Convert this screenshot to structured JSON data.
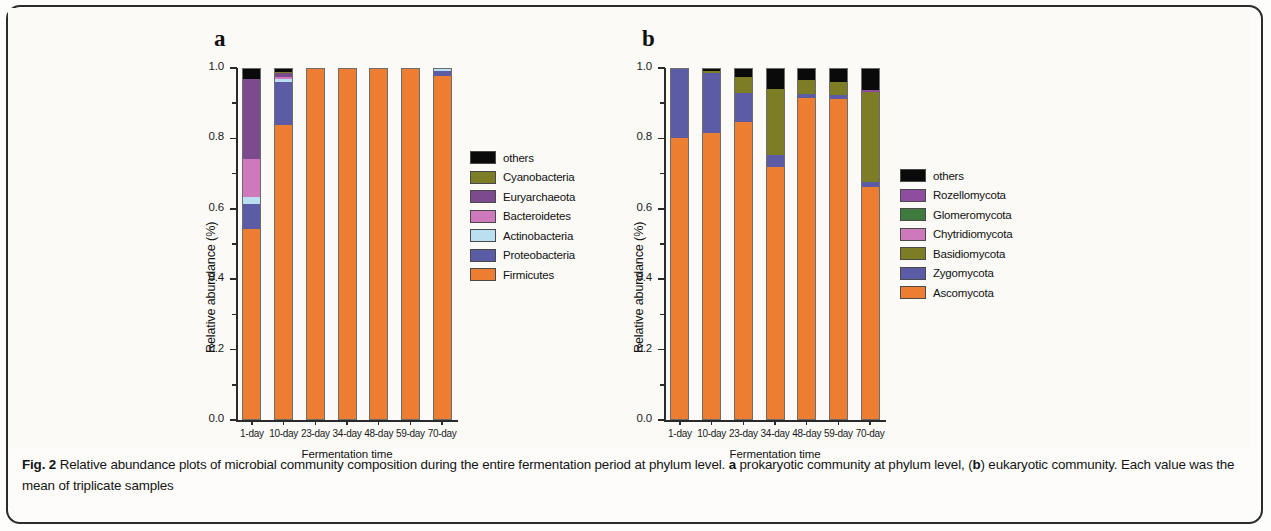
{
  "figure": {
    "label": "Fig. 2",
    "caption_part1": "Relative abundance plots of microbial community composition during the entire fermentation period at phylum level.",
    "caption_a_tag": "a",
    "caption_part2": "prokaryotic community at phylum level, (",
    "caption_b_tag": "b",
    "caption_part3": ") eukaryotic community. Each value was the mean of triplicate samples"
  },
  "panel_a": {
    "letter": "a",
    "ylabel": "Relative abundance (%)",
    "xlabel": "Fermentation time"
  },
  "panel_b": {
    "letter": "b",
    "ylabel": "Relative abundance (%)",
    "xlabel": "Fermentation time"
  },
  "chart_data": [
    {
      "type": "bar",
      "panel": "a",
      "title": "prokaryotic community at phylum level",
      "stacked": true,
      "normalized": true,
      "xlabel": "Fermentation time",
      "ylabel": "Relative abundance (%)",
      "ylim": [
        0.0,
        1.0
      ],
      "ytick_labels": [
        "0.0",
        "0.2",
        "0.4",
        "0.6",
        "0.8",
        "1.0"
      ],
      "ytick_values": [
        0.0,
        0.2,
        0.4,
        0.6,
        0.8,
        1.0
      ],
      "yminor_values": [
        0.1,
        0.3,
        0.5,
        0.7,
        0.9
      ],
      "grid": false,
      "legend_position": "right",
      "categories": [
        "1-day",
        "10-day",
        "23-day",
        "34-day",
        "48-day",
        "59-day",
        "70-day"
      ],
      "series": [
        {
          "name": "Firmicutes",
          "color": "#ed7d31",
          "values": [
            0.54,
            0.835,
            1.0,
            1.0,
            1.0,
            0.993,
            0.975
          ]
        },
        {
          "name": "Proteobacteria",
          "color": "#5b5ba6",
          "values": [
            0.07,
            0.122,
            0.0,
            0.0,
            0.0,
            0.0,
            0.015
          ]
        },
        {
          "name": "Actinobacteria",
          "color": "#b9dff0",
          "values": [
            0.02,
            0.008,
            0.0,
            0.0,
            0.0,
            0.0,
            0.003
          ]
        },
        {
          "name": "Bacteroidetes",
          "color": "#cd79bb",
          "values": [
            0.11,
            0.007,
            0.0,
            0.0,
            0.0,
            0.0,
            0.0
          ]
        },
        {
          "name": "Euryarchaeota",
          "color": "#7c4b8d",
          "values": [
            0.225,
            0.011,
            0.0,
            0.0,
            0.0,
            0.0,
            0.0
          ]
        },
        {
          "name": "Cyanobacteria",
          "color": "#7d7d25",
          "values": [
            0.0,
            0.004,
            0.0,
            0.0,
            0.0,
            0.0,
            0.0
          ]
        },
        {
          "name": "others",
          "color": "#0a0a0a",
          "values": [
            0.035,
            0.013,
            0.0,
            0.0,
            0.0,
            0.007,
            0.007
          ]
        }
      ],
      "legend_order": [
        "others",
        "Cyanobacteria",
        "Euryarchaeota",
        "Bacteroidetes",
        "Actinobacteria",
        "Proteobacteria",
        "Firmicutes"
      ]
    },
    {
      "type": "bar",
      "panel": "b",
      "title": "eukaryotic community",
      "stacked": true,
      "normalized": true,
      "xlabel": "Fermentation time",
      "ylabel": "Relative abundance (%)",
      "ylim": [
        0.0,
        1.0
      ],
      "ytick_labels": [
        "0.0",
        "0.2",
        "0.4",
        "0.6",
        "0.8",
        "1.0"
      ],
      "ytick_values": [
        0.0,
        0.2,
        0.4,
        0.6,
        0.8,
        1.0
      ],
      "yminor_values": [
        0.1,
        0.3,
        0.5,
        0.7,
        0.9
      ],
      "grid": false,
      "legend_position": "right",
      "categories": [
        "1-day",
        "10-day",
        "23-day",
        "34-day",
        "48-day",
        "59-day",
        "70-day"
      ],
      "series": [
        {
          "name": "Ascomycota",
          "color": "#ed7d31",
          "values": [
            0.797,
            0.812,
            0.843,
            0.715,
            0.912,
            0.91,
            0.66
          ]
        },
        {
          "name": "Zygomycota",
          "color": "#5b5ba6",
          "values": [
            0.196,
            0.17,
            0.084,
            0.035,
            0.01,
            0.01,
            0.012
          ]
        },
        {
          "name": "Basidiomycota",
          "color": "#7d7d25",
          "values": [
            0.0,
            0.008,
            0.044,
            0.188,
            0.04,
            0.038,
            0.258
          ]
        },
        {
          "name": "Chytridiomycota",
          "color": "#cd79bb",
          "values": [
            0.0,
            0.0,
            0.0,
            0.0,
            0.0,
            0.0,
            0.0
          ]
        },
        {
          "name": "Glomeromycota",
          "color": "#3f7b3f",
          "values": [
            0.0,
            0.0,
            0.0,
            0.0,
            0.0,
            0.0,
            0.0
          ]
        },
        {
          "name": "Rozellomycota",
          "color": "#8e4d9e",
          "values": [
            0.0,
            0.0,
            0.0,
            0.0,
            0.0,
            0.0,
            0.004
          ]
        },
        {
          "name": "others",
          "color": "#0a0a0a",
          "values": [
            0.007,
            0.01,
            0.029,
            0.062,
            0.038,
            0.042,
            0.066
          ]
        }
      ],
      "legend_order": [
        "others",
        "Rozellomycota",
        "Glomeromycota",
        "Chytridiomycota",
        "Basidiomycota",
        "Zygomycota",
        "Ascomycota"
      ]
    }
  ]
}
